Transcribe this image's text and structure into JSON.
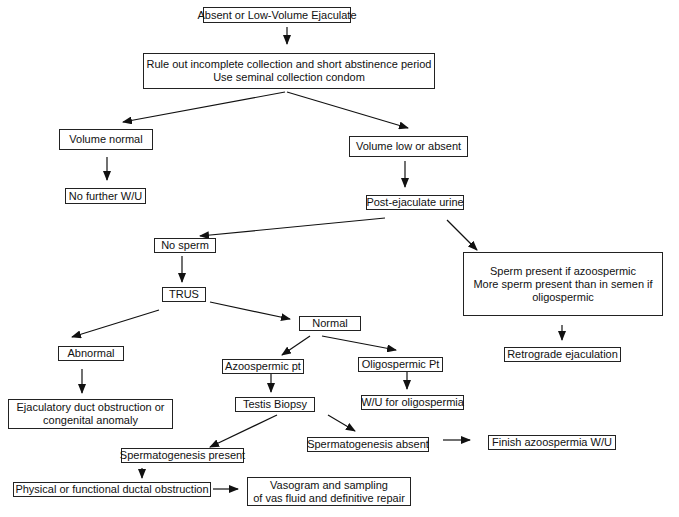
{
  "diagram": {
    "type": "flowchart",
    "nodes": {
      "start": {
        "lines": [
          "Absent or Low-Volume Ejaculate"
        ]
      },
      "rule_out": {
        "lines": [
          "Rule out incomplete collection and short abstinence period",
          "Use seminal collection condom"
        ]
      },
      "volume_normal": {
        "lines": [
          "Volume normal"
        ]
      },
      "no_further": {
        "lines": [
          "No further W/U"
        ]
      },
      "volume_low": {
        "lines": [
          "Volume low  or absent"
        ]
      },
      "post_ejac": {
        "lines": [
          "Post-ejaculate urine"
        ]
      },
      "no_sperm": {
        "lines": [
          "No sperm"
        ]
      },
      "sperm_present": {
        "lines": [
          "Sperm present if azoospermic",
          "More sperm present than in semen if",
          "oligospermic"
        ]
      },
      "retrograde": {
        "lines": [
          "Retrograde ejaculation"
        ]
      },
      "trus": {
        "lines": [
          "TRUS"
        ]
      },
      "abnormal": {
        "lines": [
          "Abnormal"
        ]
      },
      "normal": {
        "lines": [
          "Normal"
        ]
      },
      "ejac_duct": {
        "lines": [
          "Ejaculatory duct obstruction or",
          "congenital anomaly"
        ]
      },
      "azoospermic": {
        "lines": [
          "Azoospermic pt"
        ]
      },
      "oligospermic": {
        "lines": [
          "Oligospermic Pt"
        ]
      },
      "wu_oligo": {
        "lines": [
          "W/U for oligospermia"
        ]
      },
      "testis_biopsy": {
        "lines": [
          "Testis Biopsy"
        ]
      },
      "spermato_present": {
        "lines": [
          "Spermatogenesis present"
        ]
      },
      "spermato_absent": {
        "lines": [
          "Spermatogenesis absent"
        ]
      },
      "finish_azoo": {
        "lines": [
          "Finish azoospermia W/U"
        ]
      },
      "physical_obstr": {
        "lines": [
          "Physical or functional ductal obstruction"
        ]
      },
      "vasogram": {
        "lines": [
          "Vasogram and sampling",
          "of vas fluid and definitive repair"
        ]
      }
    },
    "edges": [
      [
        "start",
        "rule_out"
      ],
      [
        "rule_out",
        "volume_normal"
      ],
      [
        "rule_out",
        "volume_low"
      ],
      [
        "volume_normal",
        "no_further"
      ],
      [
        "volume_low",
        "post_ejac"
      ],
      [
        "post_ejac",
        "no_sperm"
      ],
      [
        "post_ejac",
        "sperm_present"
      ],
      [
        "sperm_present",
        "retrograde"
      ],
      [
        "no_sperm",
        "trus"
      ],
      [
        "trus",
        "abnormal"
      ],
      [
        "trus",
        "normal"
      ],
      [
        "abnormal",
        "ejac_duct"
      ],
      [
        "normal",
        "azoospermic"
      ],
      [
        "normal",
        "oligospermic"
      ],
      [
        "oligospermic",
        "wu_oligo"
      ],
      [
        "azoospermic",
        "testis_biopsy"
      ],
      [
        "testis_biopsy",
        "spermato_present"
      ],
      [
        "testis_biopsy",
        "spermato_absent"
      ],
      [
        "spermato_absent",
        "finish_azoo"
      ],
      [
        "spermato_present",
        "physical_obstr"
      ],
      [
        "physical_obstr",
        "vasogram"
      ]
    ]
  }
}
